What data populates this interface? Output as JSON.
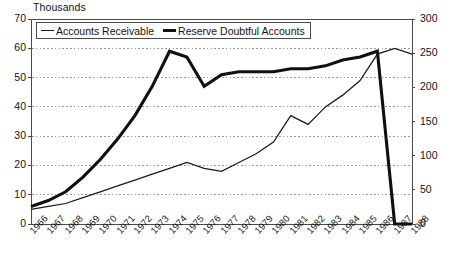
{
  "chart_data": {
    "type": "line",
    "title": "Thousands",
    "xlabel": "",
    "ylabel": "Thousands",
    "grid": true,
    "legend_position": "top-left-inside",
    "x": [
      "1966",
      "1967",
      "1968",
      "1969",
      "1970",
      "1971",
      "1972",
      "1973",
      "1974",
      "1975",
      "1976",
      "1977",
      "1978",
      "1979",
      "1980",
      "1981",
      "1982",
      "1983",
      "1984",
      "1985",
      "1986",
      "1987",
      "1988"
    ],
    "left_axis": {
      "ticks": [
        0,
        10,
        20,
        30,
        40,
        50,
        60,
        70
      ],
      "ylim": [
        0,
        70
      ]
    },
    "right_axis": {
      "ticks": [
        0,
        50,
        100,
        150,
        200,
        250,
        300
      ],
      "ylim": [
        0,
        300
      ]
    },
    "series": [
      {
        "name": "Accounts Receivable",
        "axis": "right",
        "style": "thin",
        "values": [
          22,
          26,
          30,
          40,
          48,
          58,
          66,
          74,
          82,
          90,
          82,
          78,
          90,
          104,
          120,
          158,
          146,
          170,
          190,
          210,
          250,
          256,
          250
        ],
        "values_left_scale": [
          5,
          6,
          7,
          9,
          11,
          13,
          15,
          17,
          19,
          21,
          19,
          18,
          21,
          24,
          28,
          37,
          34,
          40,
          44,
          49,
          58,
          60,
          58
        ]
      },
      {
        "name": "Reserve Doubtful Accounts",
        "axis": "left",
        "style": "thick",
        "values": [
          6,
          8,
          11,
          16,
          22,
          29,
          37,
          47,
          59,
          57,
          47,
          51,
          52,
          52,
          52,
          53,
          53,
          54,
          56,
          57,
          59,
          0,
          0
        ],
        "values_right_scale": [
          26,
          34,
          47,
          69,
          94,
          124,
          159,
          201,
          253,
          244,
          201,
          219,
          223,
          223,
          223,
          227,
          227,
          231,
          240,
          244,
          253,
          0,
          0
        ]
      }
    ]
  },
  "legend": {
    "entries": [
      {
        "label": "Accounts Receivable",
        "style": "thin"
      },
      {
        "label": "Reserve Doubtful Accounts",
        "style": "thick"
      }
    ]
  },
  "colors": {
    "line_thin": "#1a1a1a",
    "line_thick": "#101010",
    "grid": "#9a9a9a",
    "axis": "#4a4a4a",
    "text": "#141414",
    "background": "#ffffff"
  }
}
